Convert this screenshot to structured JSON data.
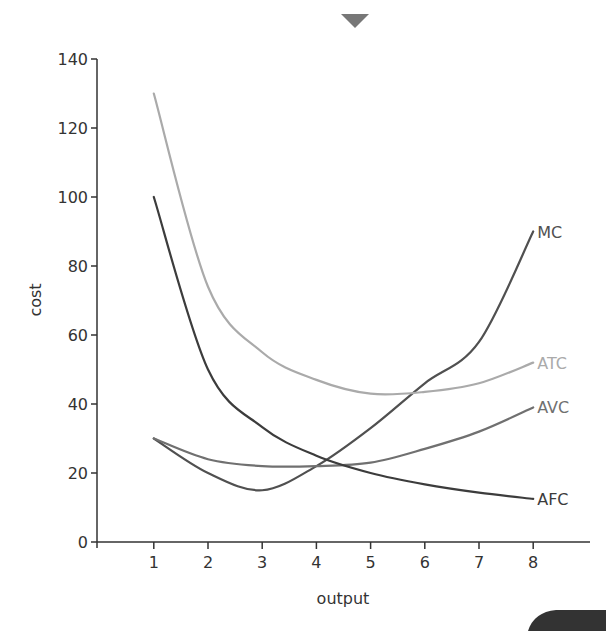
{
  "chart_data": {
    "type": "line",
    "title": "",
    "xlabel": "output",
    "ylabel": "cost",
    "xlim": [
      0,
      9
    ],
    "ylim": [
      0,
      140
    ],
    "x_ticks": [
      1,
      2,
      3,
      4,
      5,
      6,
      7,
      8
    ],
    "y_ticks": [
      0,
      20,
      40,
      60,
      80,
      100,
      120,
      140
    ],
    "grid": false,
    "legend_position": "inline-right",
    "x": [
      1,
      2,
      3,
      4,
      5,
      6,
      7,
      8
    ],
    "series": [
      {
        "name": "MC",
        "color": "#505050",
        "values": [
          30,
          20,
          15,
          22,
          33,
          46,
          58,
          90
        ]
      },
      {
        "name": "ATC",
        "color": "#aaaaaa",
        "values": [
          130,
          74,
          55,
          47,
          43,
          43.5,
          46,
          52
        ]
      },
      {
        "name": "AVC",
        "color": "#707070",
        "values": [
          30,
          24,
          22,
          22,
          23,
          27,
          32,
          39
        ]
      },
      {
        "name": "AFC",
        "color": "#3c3c3c",
        "values": [
          100,
          50,
          33.3,
          25,
          20,
          16.7,
          14.3,
          12.5
        ]
      }
    ]
  },
  "decorations": {
    "top_marker": "down-triangle-marker",
    "bottom_right_tab": "dark-rounded-tab"
  }
}
